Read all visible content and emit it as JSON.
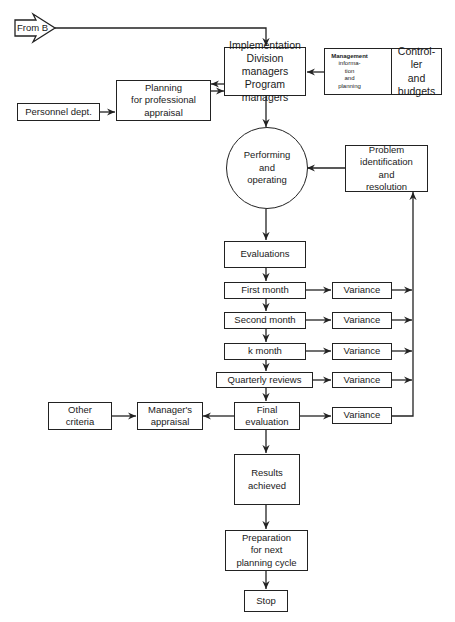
{
  "diagram": {
    "type": "flowchart",
    "entry": {
      "label": "From B"
    },
    "nodes": {
      "implementation": {
        "lines": [
          "Implementation",
          "Division managers",
          "Program managers"
        ]
      },
      "management_info": {
        "lines": [
          "Management",
          "informa-",
          "tion",
          "and",
          "planning"
        ]
      },
      "controller": {
        "lines": [
          "Control-",
          "ler",
          "and",
          "budgets"
        ]
      },
      "planning": {
        "lines": [
          "Planning",
          "for professional",
          "appraisal"
        ]
      },
      "personnel": {
        "label": "Personnel dept."
      },
      "performing": {
        "lines": [
          "Performing",
          "and",
          "operating"
        ]
      },
      "problem": {
        "lines": [
          "Problem",
          "identification",
          "and",
          "resolution"
        ]
      },
      "evaluations": {
        "label": "Evaluations"
      },
      "first_month": {
        "label": "First month"
      },
      "second_month": {
        "label": "Second month"
      },
      "k_month": {
        "label": "k month"
      },
      "quarterly": {
        "label": "Quarterly reviews"
      },
      "final_evaluation": {
        "lines": [
          "Final",
          "evaluation"
        ]
      },
      "variance": {
        "label": "Variance"
      },
      "managers_appraisal": {
        "lines": [
          "Manager's",
          "appraisal"
        ]
      },
      "other_criteria": {
        "lines": [
          "Other",
          "criteria"
        ]
      },
      "results": {
        "lines": [
          "Results",
          "achieved"
        ]
      },
      "preparation": {
        "lines": [
          "Preparation",
          "for next",
          "planning cycle"
        ]
      },
      "stop": {
        "label": "Stop"
      }
    },
    "edges": [
      [
        "From B",
        "Implementation"
      ],
      [
        "Management information and planning",
        "Implementation"
      ],
      [
        "Controller and budgets",
        "Management information and planning"
      ],
      [
        "Management information and planning",
        "Controller and budgets"
      ],
      [
        "Implementation",
        "Planning for professional appraisal"
      ],
      [
        "Planning for professional appraisal",
        "Implementation"
      ],
      [
        "Personnel dept.",
        "Planning for professional appraisal"
      ],
      [
        "Implementation",
        "Performing and operating"
      ],
      [
        "Problem identification and resolution",
        "Performing and operating"
      ],
      [
        "Performing and operating",
        "Evaluations"
      ],
      [
        "Evaluations",
        "First month"
      ],
      [
        "First month",
        "Second month"
      ],
      [
        "Second month",
        "k month"
      ],
      [
        "k month",
        "Quarterly reviews"
      ],
      [
        "Quarterly reviews",
        "Final evaluation"
      ],
      [
        "First month",
        "Variance"
      ],
      [
        "Second month",
        "Variance"
      ],
      [
        "k month",
        "Variance"
      ],
      [
        "Quarterly reviews",
        "Variance"
      ],
      [
        "Final evaluation",
        "Variance"
      ],
      [
        "Variance",
        "Problem identification and resolution"
      ],
      [
        "Final evaluation",
        "Manager's appraisal"
      ],
      [
        "Other criteria",
        "Manager's appraisal"
      ],
      [
        "Final evaluation",
        "Results achieved"
      ],
      [
        "Results achieved",
        "Preparation for next planning cycle"
      ],
      [
        "Preparation for next planning cycle",
        "Stop"
      ]
    ]
  }
}
